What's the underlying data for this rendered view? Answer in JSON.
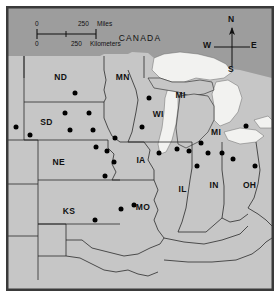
{
  "figure": {
    "name": "midwest-united-states-reference-map",
    "frame_color": "#3a3a3a",
    "background_color": "#ffffff",
    "water_color": "#f2f2f0",
    "land_color": "#c6c6c6",
    "outside_color": "#9d9d9d",
    "border_line_color": "#222222",
    "marker_color": "#000000"
  },
  "scale": {
    "miles": {
      "zero": "0",
      "value": "250",
      "unit": "Miles"
    },
    "kilometers": {
      "zero": "0",
      "value": "250",
      "unit": "Kilometers"
    }
  },
  "compass": {
    "north": "N",
    "south": "S",
    "east": "E",
    "west": "W"
  },
  "country_labels": [
    {
      "name": "CANADA",
      "x": 130,
      "y": 30
    }
  ],
  "state_labels": [
    {
      "code": "ND",
      "x": 52,
      "y": 68
    },
    {
      "code": "MN",
      "x": 113,
      "y": 68
    },
    {
      "code": "SD",
      "x": 38,
      "y": 112
    },
    {
      "code": "MI",
      "x": 170,
      "y": 86
    },
    {
      "code": "WI",
      "x": 148,
      "y": 105
    },
    {
      "code": "MI",
      "x": 205,
      "y": 122
    },
    {
      "code": "NE",
      "x": 50,
      "y": 152
    },
    {
      "code": "IA",
      "x": 131,
      "y": 150
    },
    {
      "code": "IL",
      "x": 172,
      "y": 178
    },
    {
      "code": "IN",
      "x": 203,
      "y": 175
    },
    {
      "code": "OH",
      "x": 238,
      "y": 175
    },
    {
      "code": "KS",
      "x": 60,
      "y": 200
    },
    {
      "code": "MO",
      "x": 133,
      "y": 196
    }
  ],
  "markers": [
    {
      "x": 66,
      "y": 84
    },
    {
      "x": 8,
      "y": 117
    },
    {
      "x": 22,
      "y": 125
    },
    {
      "x": 56,
      "y": 104
    },
    {
      "x": 80,
      "y": 104
    },
    {
      "x": 61,
      "y": 120
    },
    {
      "x": 84,
      "y": 120
    },
    {
      "x": 105,
      "y": 128
    },
    {
      "x": 87,
      "y": 137
    },
    {
      "x": 98,
      "y": 141
    },
    {
      "x": 104,
      "y": 152
    },
    {
      "x": 96,
      "y": 166
    },
    {
      "x": 86,
      "y": 209
    },
    {
      "x": 111,
      "y": 198
    },
    {
      "x": 124,
      "y": 194
    },
    {
      "x": 139,
      "y": 89
    },
    {
      "x": 132,
      "y": 117
    },
    {
      "x": 149,
      "y": 143
    },
    {
      "x": 166,
      "y": 139
    },
    {
      "x": 178,
      "y": 141
    },
    {
      "x": 190,
      "y": 133
    },
    {
      "x": 197,
      "y": 143
    },
    {
      "x": 211,
      "y": 143
    },
    {
      "x": 222,
      "y": 149
    },
    {
      "x": 186,
      "y": 156
    },
    {
      "x": 243,
      "y": 156
    },
    {
      "x": 234,
      "y": 116
    }
  ]
}
